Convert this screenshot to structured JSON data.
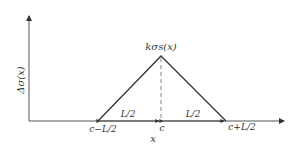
{
  "diagram": {
    "y_axis_label": "Δσ(x)",
    "x_axis_label": "x",
    "apex_label": "kσs(x)",
    "left_half_width_label": "L/2",
    "right_half_width_label": "L/2",
    "tick_left": "c−L/2",
    "tick_center": "c",
    "tick_right": "c+L/2",
    "colors": {
      "line": "#333333",
      "dashed": "#888888",
      "background": "#ffffff"
    }
  }
}
